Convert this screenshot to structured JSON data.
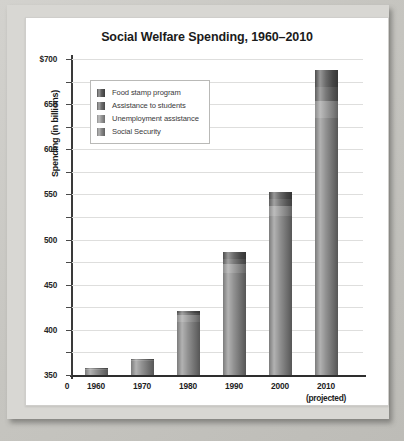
{
  "chart_data": {
    "type": "bar",
    "stacked": true,
    "title": "Social Welfare Spending, 1960–2010",
    "xlabel": "Year",
    "ylabel": "Spending (in billions)",
    "categories": [
      "1960",
      "1970",
      "1980",
      "1990",
      "2000",
      "2010"
    ],
    "category_sublabels": [
      "",
      "",
      "",
      "",
      "",
      "(projected)"
    ],
    "ylim": [
      0,
      700
    ],
    "ytick_values": [
      0,
      50,
      100,
      150,
      200,
      250,
      300,
      350,
      400,
      450,
      500,
      550,
      600,
      650,
      700
    ],
    "ytick_labels": [
      "0",
      "50",
      "100",
      "150",
      "200",
      "250",
      "300",
      "350",
      "400",
      "450",
      "500",
      "550",
      "600",
      "650",
      "$700"
    ],
    "xtick_labels": [
      "0",
      "1960",
      "1970",
      "1980",
      "1990",
      "2000",
      "2010"
    ],
    "grid": true,
    "legend_position": "upper-left-inside",
    "series": [
      {
        "name": "Social Security",
        "color": "#7b7b7b",
        "values": [
          11,
          30,
          118,
          227,
          353,
          570
        ]
      },
      {
        "name": "Unemployment assistance",
        "color": "#8d8d8d",
        "values": [
          3,
          3,
          16,
          18,
          21,
          36
        ]
      },
      {
        "name": "Assistance to students",
        "color": "#5f5f5f",
        "values": [
          1,
          2,
          4,
          13,
          16,
          33
        ]
      },
      {
        "name": "Food stamp program",
        "color": "#4c4c4c",
        "values": [
          0,
          1,
          3,
          14,
          15,
          37
        ]
      }
    ],
    "totals": [
      15,
      36,
      141,
      272,
      405,
      676
    ]
  },
  "legend": {
    "items": [
      {
        "label": "Food stamp program",
        "color": "#4c4c4c"
      },
      {
        "label": "Assistance to students",
        "color": "#5f5f5f"
      },
      {
        "label": "Unemployment assistance",
        "color": "#8d8d8d"
      },
      {
        "label": "Social Security",
        "color": "#7b7b7b"
      }
    ]
  }
}
